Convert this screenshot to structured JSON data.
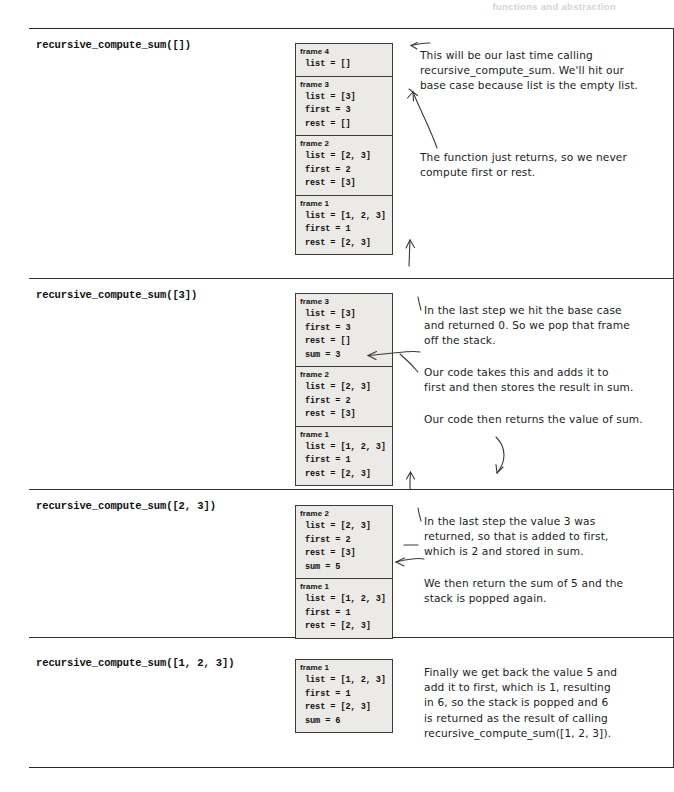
{
  "running_header": "functions and abstraction",
  "colors": {
    "page_background": "#ffffff",
    "rule": "#262626",
    "frame_fill": "#eceae6",
    "frame_border": "#3c3c3c",
    "annotation_ink": "#222222",
    "header_ink": "#b9b9c2"
  },
  "sections": [
    {
      "call_label": "recursive_compute_sum([])",
      "stack": {
        "frames": [
          {
            "title": "frame 4",
            "rows": [
              "list = []"
            ]
          },
          {
            "title": "frame 3",
            "rows": [
              "list = [3]",
              "first = 3",
              "rest = []"
            ]
          },
          {
            "title": "frame 2",
            "rows": [
              "list = [2, 3]",
              "first = 2",
              "rest = [3]"
            ]
          },
          {
            "title": "frame 1",
            "rows": [
              "list = [1, 2, 3]",
              "first = 1",
              "rest = [2, 3]"
            ]
          }
        ]
      },
      "notes": [
        "This will be our last time calling\nrecursive_compute_sum. We'll hit our\nbase case because list is the empty list.",
        "The function just returns, so we never\ncompute first or rest."
      ]
    },
    {
      "call_label": "recursive_compute_sum([3])",
      "stack": {
        "frames": [
          {
            "title": "frame 3",
            "rows": [
              "list = [3]",
              "first = 3",
              "rest = []",
              "sum = 3"
            ]
          },
          {
            "title": "frame 2",
            "rows": [
              "list = [2, 3]",
              "first = 2",
              "rest = [3]"
            ]
          },
          {
            "title": "frame 1",
            "rows": [
              "list = [1, 2, 3]",
              "first = 1",
              "rest = [2, 3]"
            ]
          }
        ]
      },
      "notes": [
        "In the last step we hit the base case\nand returned 0. So we pop that frame\noff the stack.",
        "Our code takes this and adds it to\nfirst and then stores the result in sum.",
        "Our code then returns the value of sum."
      ]
    },
    {
      "call_label": "recursive_compute_sum([2, 3])",
      "stack": {
        "frames": [
          {
            "title": "frame 2",
            "rows": [
              "list = [2, 3]",
              "first = 2",
              "rest = [3]",
              "sum = 5"
            ]
          },
          {
            "title": "frame 1",
            "rows": [
              "list = [1, 2, 3]",
              "first = 1",
              "rest = [2, 3]"
            ]
          }
        ]
      },
      "notes": [
        "In the last step the value 3 was\nreturned, so that is added to first,\nwhich is 2 and stored in sum.",
        "We then return the sum of 5 and the\nstack is popped again."
      ]
    },
    {
      "call_label": "recursive_compute_sum([1, 2, 3])",
      "stack": {
        "frames": [
          {
            "title": "frame 1",
            "rows": [
              "list = [1, 2, 3]",
              "first = 1",
              "rest = [2, 3]",
              "sum = 6"
            ]
          }
        ]
      },
      "notes": [
        "Finally we get back the value 5 and\nadd it to first, which is 1, resulting\nin 6, so  the stack is popped and 6\nis returned as the result of calling\nrecursive_compute_sum([1, 2, 3])."
      ]
    }
  ]
}
